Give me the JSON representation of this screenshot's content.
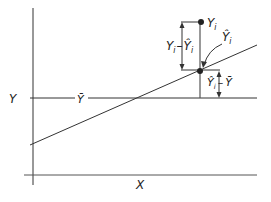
{
  "diagram": {
    "axis_labels": {
      "y": "Y",
      "x": "X"
    },
    "mean_label": "Ȳ",
    "point_label": "Y",
    "point_sub": "i",
    "fitted_label": "Ŷ",
    "fitted_sub": "i",
    "residual_label": {
      "a": "Y",
      "a_sub": "i",
      "minus": "–",
      "b": "Ŷ",
      "b_sub": "i"
    },
    "explained_label": {
      "a": "Ŷ",
      "a_sub": "i",
      "minus": "–",
      "b": "Ȳ"
    },
    "colors": {
      "line": "#333333",
      "text": "#222222"
    }
  }
}
